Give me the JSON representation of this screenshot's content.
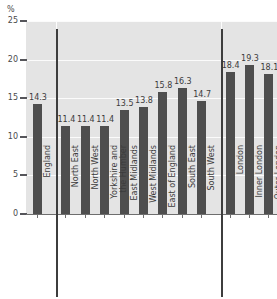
{
  "chart_data": {
    "type": "bar",
    "title": "",
    "xlabel": "",
    "ylabel": "%",
    "unit": "%",
    "ylim": [
      0,
      25
    ],
    "yticks": [
      0,
      5,
      10,
      15,
      20,
      25
    ],
    "grid": true,
    "legend": "none",
    "orientation": "vertical",
    "bar_color": "#4e4e4e",
    "plot_background": "#e4e4e4",
    "gridline_color": "#fbfbfb",
    "categories": [
      "England",
      "North East",
      "North West",
      "Yorkshire and\nthe Humber",
      "East Midlands",
      "West Midlands",
      "East of England",
      "South East",
      "South West",
      "London",
      "Inner London",
      "Outer London"
    ],
    "values": [
      14.3,
      11.4,
      11.4,
      11.4,
      13.5,
      13.8,
      15.8,
      16.3,
      14.7,
      18.4,
      19.3,
      18.1
    ],
    "value_labels": [
      "14.3",
      "11.4",
      "11.4",
      "11.4",
      "13.5",
      "13.8",
      "15.8",
      "16.3",
      "14.7",
      "18.4",
      "19.3",
      "18.1"
    ],
    "groups": [
      {
        "name": "England",
        "indices": [
          0
        ]
      },
      {
        "name": "Regions",
        "indices": [
          1,
          2,
          3,
          4,
          5,
          6,
          7,
          8
        ]
      },
      {
        "name": "London",
        "indices": [
          9,
          10,
          11
        ]
      }
    ],
    "group_separator_after": [
      0,
      8
    ],
    "ytick_labels": [
      "0",
      "5",
      "10",
      "15",
      "20",
      "25"
    ]
  }
}
